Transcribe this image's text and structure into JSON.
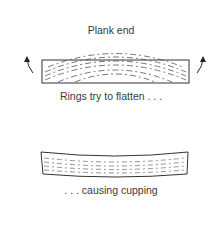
{
  "title": "Plank end",
  "caption_top": "Rings try to flatten . . .",
  "caption_bottom": ". . . causing cupping",
  "icons": {
    "left_arrow": "curved-arrow-up-left",
    "right_arrow": "curved-arrow-up-right"
  }
}
